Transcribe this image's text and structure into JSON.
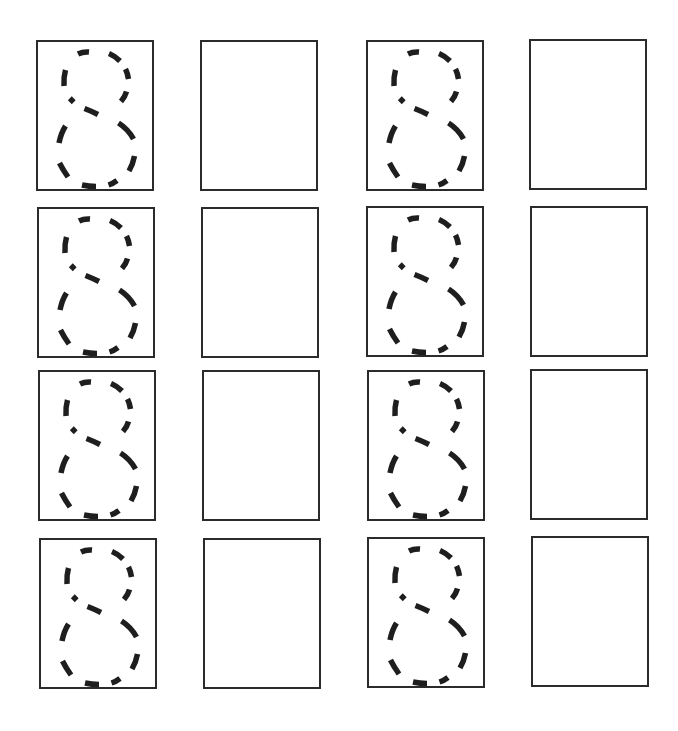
{
  "worksheet": {
    "title": "",
    "digit": "8",
    "ink_color": "#1e1e1e",
    "border_color": "#2b2b2b",
    "background": "#ffffff",
    "rows": [
      {
        "cells": [
          {
            "type": "trace",
            "digit": "8",
            "x": 36,
            "y": 40
          },
          {
            "type": "blank",
            "x": 200,
            "y": 40
          },
          {
            "type": "trace",
            "digit": "8",
            "x": 366,
            "y": 40
          },
          {
            "type": "blank",
            "x": 529,
            "y": 39
          }
        ]
      },
      {
        "cells": [
          {
            "type": "trace",
            "digit": "8",
            "x": 37,
            "y": 207
          },
          {
            "type": "blank",
            "x": 201,
            "y": 207
          },
          {
            "type": "trace",
            "digit": "8",
            "x": 366,
            "y": 206
          },
          {
            "type": "blank",
            "x": 530,
            "y": 206
          }
        ]
      },
      {
        "cells": [
          {
            "type": "trace",
            "digit": "8",
            "x": 38,
            "y": 370
          },
          {
            "type": "blank",
            "x": 202,
            "y": 370
          },
          {
            "type": "trace",
            "digit": "8",
            "x": 367,
            "y": 370
          },
          {
            "type": "blank",
            "x": 530,
            "y": 369
          }
        ]
      },
      {
        "cells": [
          {
            "type": "trace",
            "digit": "8",
            "x": 39,
            "y": 538
          },
          {
            "type": "blank",
            "x": 203,
            "y": 538
          },
          {
            "type": "trace",
            "digit": "8",
            "x": 367,
            "y": 537
          },
          {
            "type": "blank",
            "x": 531,
            "y": 536
          }
        ]
      }
    ]
  }
}
